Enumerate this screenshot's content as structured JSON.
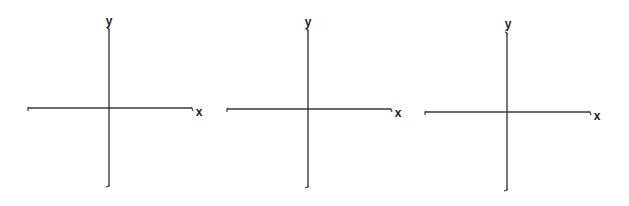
{
  "figure": {
    "width": 629,
    "height": 206,
    "background": "#ffffff",
    "stroke_color": "#3a3a3a",
    "label_color": "#222222"
  },
  "plots": [
    {
      "id": "plot-1",
      "origin": [
        109,
        108
      ],
      "x_axis": {
        "x1": 28,
        "x2": 192,
        "y": 108,
        "label": "x",
        "label_pos": [
          199,
          112
        ]
      },
      "y_axis": {
        "y1": 29,
        "y2": 186,
        "x": 109,
        "label": "y",
        "label_pos": [
          109,
          22
        ]
      }
    },
    {
      "id": "plot-2",
      "origin": [
        308,
        109
      ],
      "x_axis": {
        "x1": 227,
        "x2": 391,
        "y": 109,
        "label": "x",
        "label_pos": [
          398,
          113
        ]
      },
      "y_axis": {
        "y1": 30,
        "y2": 187,
        "x": 308,
        "label": "y",
        "label_pos": [
          308,
          23
        ]
      }
    },
    {
      "id": "plot-3",
      "origin": [
        507,
        112
      ],
      "x_axis": {
        "x1": 425,
        "x2": 590,
        "y": 112,
        "label": "x",
        "label_pos": [
          597,
          116
        ]
      },
      "y_axis": {
        "y1": 33,
        "y2": 190,
        "x": 507,
        "label": "y",
        "label_pos": [
          508,
          25
        ]
      }
    }
  ]
}
